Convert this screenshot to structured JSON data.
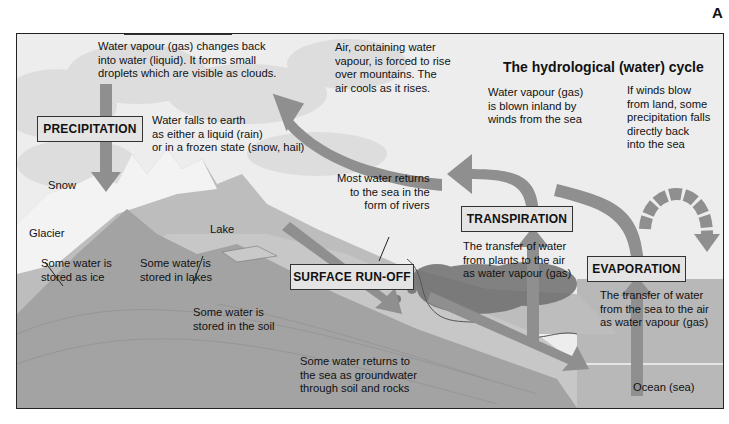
{
  "corner_label": "A",
  "title": "The hydrological (water) cycle",
  "stages": {
    "condensation": {
      "label": "CONDENSATION",
      "description": "Water vapour (gas) changes back\ninto water (liquid). It forms small\ndroplets which are visible as clouds."
    },
    "precipitation": {
      "label": "PRECIPITATION",
      "description": "Water falls to earth\nas either a liquid (rain)\nor in a frozen state (snow, hail)"
    },
    "transpiration": {
      "label": "TRANSPIRATION",
      "description": "The transfer of water\nfrom plants to the air\nas water vapour (gas)"
    },
    "evaporation": {
      "label": "EVAPORATION",
      "description": "The transfer of water\nfrom the sea to the air\nas water vapour (gas)"
    },
    "surface_runoff": {
      "label": "SURFACE RUN-OFF"
    }
  },
  "annotations": {
    "air_rises": "Air, containing water\nvapour, is forced to rise\nover mountains. The\nair cools as it rises.",
    "wind_inland": "Water vapour (gas)\nis blown inland by\nwinds from the sea",
    "winds_from_land": "If winds blow\nfrom land, some\nprecipitation falls\ndirectly back\ninto the sea",
    "rivers": "Most water returns\nto the sea in the\nform of rivers",
    "ice": "Some water is\nstored as ice",
    "lakes": "Some water is\nstored in lakes",
    "soil": "Some water is\nstored in the soil",
    "groundwater": "Some water returns to\nthe sea as groundwater\nthrough soil and rocks"
  },
  "place_labels": {
    "snow": "Snow",
    "glacier": "Glacier",
    "lake": "Lake",
    "ocean": "Ocean (sea)"
  },
  "colors": {
    "arrow": "#8f8f8f",
    "sky": "#ececec",
    "mountain": "#a9a9a9",
    "ground": "#9c9c9c",
    "sea": "#b5b5b5",
    "label_box": "#e4e4e4"
  }
}
